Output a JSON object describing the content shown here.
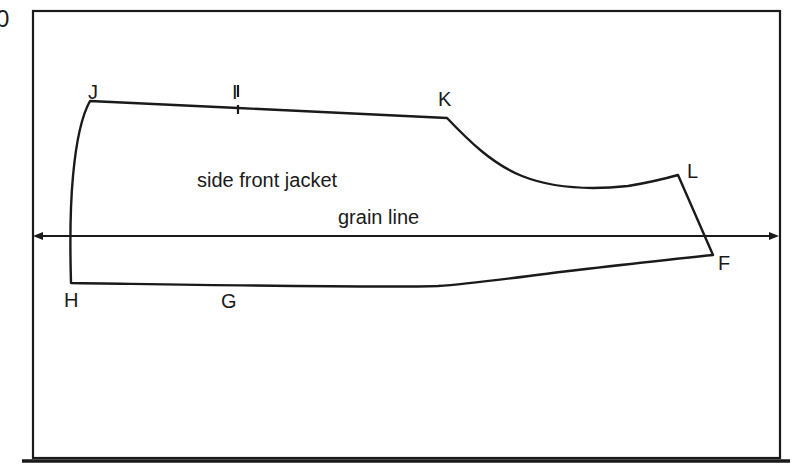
{
  "page": {
    "background_color": "#ffffff",
    "ink_color": "#1a1a1a",
    "width": 793,
    "height": 470,
    "corner_mark": "0"
  },
  "frame": {
    "name": "drawing-frame",
    "x": 33,
    "y": 11,
    "width": 747,
    "height": 447,
    "stroke_width": 2.2
  },
  "bottom_rule": {
    "x1": 22,
    "x2": 790,
    "y": 461,
    "stroke_width": 3.6
  },
  "labels": {
    "piece_name": "side front jacket",
    "grain_line": "grain line",
    "point_j": "J",
    "point_i": "I",
    "point_k": "K",
    "point_l": "L",
    "point_f": "F",
    "point_h": "H",
    "point_g": "G"
  },
  "label_positions": {
    "piece_name": {
      "x": 197,
      "y": 187
    },
    "grain_line": {
      "x": 338,
      "y": 224
    },
    "point_j": {
      "x": 88,
      "y": 99
    },
    "point_i": {
      "x": 232,
      "y": 99
    },
    "point_k": {
      "x": 438,
      "y": 106
    },
    "point_l": {
      "x": 687,
      "y": 178
    },
    "point_f": {
      "x": 718,
      "y": 270
    },
    "point_h": {
      "x": 64,
      "y": 307
    },
    "point_g": {
      "x": 221,
      "y": 308
    }
  },
  "grain_line_axis": {
    "name": "grain-line-arrow",
    "x_start": 33,
    "x_end": 779,
    "y": 236,
    "arrow_left": true,
    "arrow_right": true
  },
  "notch_i": {
    "x": 238,
    "y_top": 85,
    "y_bar_bottom": 97,
    "y_tick_start": 105,
    "y_tick_end": 113
  },
  "pattern_outline": {
    "name": "side-front-jacket-outline",
    "points": {
      "J": {
        "x": 90,
        "y": 101
      },
      "I": {
        "x": 238,
        "y": 108
      },
      "K": {
        "x": 447,
        "y": 118
      },
      "L": {
        "x": 678,
        "y": 175
      },
      "F": {
        "x": 713,
        "y": 255
      },
      "H": {
        "x": 71,
        "y": 283
      },
      "G": {
        "x": 230,
        "y": 286
      }
    },
    "segments": [
      {
        "from": "J",
        "to": "K",
        "kind": "line",
        "note": "shoulder/top edge, slight downward slope"
      },
      {
        "from": "K",
        "to": "L",
        "kind": "curve",
        "note": "concave armhole / side seam curve, low point near (580,186)"
      },
      {
        "from": "L",
        "to": "F",
        "kind": "line",
        "note": "straight side seam"
      },
      {
        "from": "F",
        "to": "H",
        "kind": "curve",
        "note": "hem edge, rises toward F"
      },
      {
        "from": "H",
        "to": "J",
        "kind": "curve",
        "note": "center front edge, slight outward bow"
      }
    ],
    "path_d": "M 90 101 L 238 108 L 447 118 C 470 138 500 166 540 180 C 568 189 600 190 636 184 C 652 181 666 178 678 175 L 713 255 C 660 262 600 270 540 278 C 495 283 460 286 430 287 C 330 288 180 285 71 283 C 70 240 71 200 74 170 C 77 140 82 116 90 101 Z"
  }
}
